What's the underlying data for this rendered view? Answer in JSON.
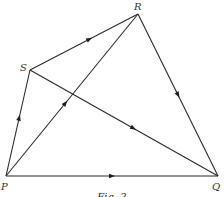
{
  "figure": {
    "caption": "Fig. 2",
    "colors": {
      "line": "#2a2a2a",
      "arrow": "#1e1e1e",
      "label": "#333333",
      "background": "#ffffff"
    }
  },
  "vertices": [
    {
      "id": "P",
      "label": "P",
      "x": 6,
      "y": 176,
      "lx": 1,
      "ly": 190
    },
    {
      "id": "Q",
      "label": "Q",
      "x": 218,
      "y": 176,
      "lx": 212,
      "ly": 190
    },
    {
      "id": "R",
      "label": "R",
      "x": 138,
      "y": 14,
      "lx": 134,
      "ly": 10
    },
    {
      "id": "S",
      "label": "S",
      "x": 30,
      "y": 70,
      "lx": 20,
      "ly": 71
    }
  ],
  "edges": [
    {
      "from": "P",
      "to": "S",
      "arrow_t": 0.55
    },
    {
      "from": "S",
      "to": "R",
      "arrow_t": 0.55
    },
    {
      "from": "P",
      "to": "R",
      "arrow_t": 0.45
    },
    {
      "from": "S",
      "to": "Q",
      "arrow_t": 0.55
    },
    {
      "from": "R",
      "to": "Q",
      "arrow_t": 0.5
    },
    {
      "from": "P",
      "to": "Q",
      "arrow_t": 0.5
    }
  ]
}
